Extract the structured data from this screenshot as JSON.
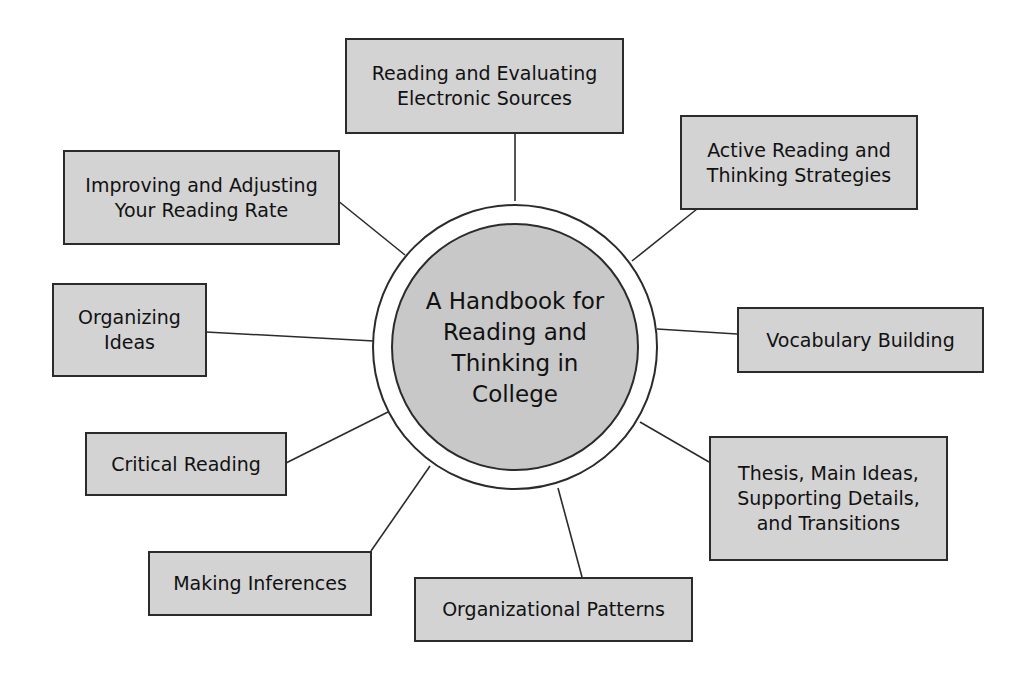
{
  "diagram": {
    "type": "concept-map",
    "colors": {
      "box_fill": "#d3d3d3",
      "box_border": "#2b2b2b",
      "hub_fill": "#c8c8c8",
      "ring_fill": "#ffffff",
      "line": "#2b2b2b",
      "background": "#ffffff"
    },
    "hub": {
      "label": "A Handbook for\nReading and\nThinking in\nCollege"
    },
    "nodes": [
      {
        "id": "electronic-sources",
        "label": "Reading and Evaluating\nElectronic Sources"
      },
      {
        "id": "active-reading",
        "label": "Active Reading and\nThinking Strategies"
      },
      {
        "id": "vocabulary",
        "label": "Vocabulary Building"
      },
      {
        "id": "thesis",
        "label": "Thesis, Main Ideas,\nSupporting Details,\nand Transitions"
      },
      {
        "id": "organizational-patterns",
        "label": "Organizational Patterns"
      },
      {
        "id": "making-inferences",
        "label": "Making Inferences"
      },
      {
        "id": "critical-reading",
        "label": "Critical Reading"
      },
      {
        "id": "organizing-ideas",
        "label": "Organizing\nIdeas"
      },
      {
        "id": "reading-rate",
        "label": "Improving and Adjusting\nYour Reading Rate"
      }
    ]
  }
}
